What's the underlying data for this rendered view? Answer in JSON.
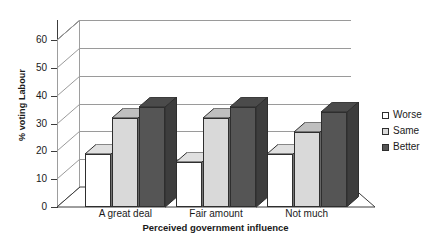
{
  "chart_data": {
    "type": "bar",
    "title": "",
    "subtitle": "",
    "xlabel": "Perceived government influence",
    "ylabel": "% voting Labour",
    "categories": [
      "A great deal",
      "Fair amount",
      "Not much"
    ],
    "series": [
      {
        "name": "Worse",
        "values": [
          19,
          16,
          19
        ],
        "color": "#ffffff"
      },
      {
        "name": "Same",
        "values": [
          32,
          32,
          27
        ],
        "color": "#d9d9d9"
      },
      {
        "name": "Better",
        "values": [
          36,
          36,
          34
        ],
        "color": "#555555"
      }
    ],
    "ylim": [
      0,
      60
    ],
    "yticks": [
      0,
      10,
      20,
      30,
      40,
      50,
      60
    ],
    "ytick_labels": [
      "0",
      "10",
      "20",
      "30",
      "40",
      "50",
      "60"
    ],
    "grid": true,
    "grid_axis": "y",
    "legend_position": "right",
    "style": "3d-column",
    "border_color": "#2e2e2e",
    "gridline_color": "#9a9a9a",
    "axis_color": "#3c3c3c",
    "background": "#ffffff"
  },
  "legend": {
    "items": [
      {
        "label": "Worse",
        "swatch": "legend-swatch-worse"
      },
      {
        "label": "Same",
        "swatch": "legend-swatch-same"
      },
      {
        "label": "Better",
        "swatch": "legend-swatch-better"
      }
    ]
  }
}
